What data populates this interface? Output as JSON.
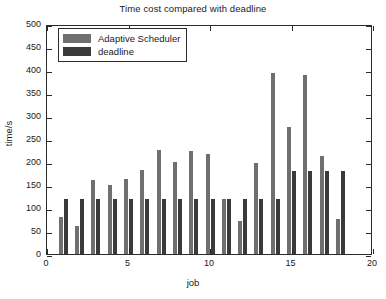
{
  "chart_data": {
    "type": "bar",
    "title": "Time cost compared with deadline",
    "xlabel": "job",
    "ylabel": "time/s",
    "xlim": [
      0,
      20
    ],
    "ylim": [
      0,
      500
    ],
    "xticks": [
      0,
      5,
      10,
      15,
      20
    ],
    "yticks": [
      0,
      50,
      100,
      150,
      200,
      250,
      300,
      350,
      400,
      450,
      500
    ],
    "xtick_labels": [
      "0",
      "5",
      "10",
      "15",
      "20"
    ],
    "ytick_labels": [
      "0",
      "50",
      "100",
      "150",
      "200",
      "250",
      "300",
      "350",
      "400",
      "450",
      "500"
    ],
    "grid": false,
    "legend_position": "upper-left",
    "categories": [
      1,
      2,
      3,
      4,
      5,
      6,
      7,
      8,
      9,
      10,
      11,
      12,
      13,
      14,
      15,
      16,
      17,
      18
    ],
    "series": [
      {
        "name": "Adaptive Scheduler",
        "color": "#6f6f6f",
        "values": [
          80,
          60,
          160,
          151,
          162,
          182,
          227,
          200,
          224,
          217,
          120,
          72,
          197,
          393,
          277,
          390,
          214,
          77
        ]
      },
      {
        "name": "deadline",
        "color": "#3a3a3a",
        "values": [
          120,
          120,
          120,
          120,
          120,
          120,
          120,
          120,
          120,
          120,
          120,
          120,
          120,
          120,
          181,
          181,
          181,
          181
        ]
      }
    ]
  },
  "legend": {
    "items": [
      {
        "label": "Adaptive Scheduler"
      },
      {
        "label": "deadline"
      }
    ]
  },
  "colors": {
    "series_0": "#6f6f6f",
    "series_1": "#3a3a3a",
    "axis": "#2b2b2b",
    "text": "#1a1a1a",
    "background": "#ffffff"
  }
}
